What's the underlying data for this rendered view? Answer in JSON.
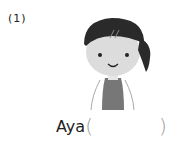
{
  "question": {
    "number": "(1)",
    "name": "Aya",
    "open_paren": "(",
    "close_paren": ")",
    "answer_value": ""
  },
  "colors": {
    "hair": "#2a2a2a",
    "skin": "#dcdcdc",
    "shirt": "#777777",
    "outline": "#999999"
  }
}
